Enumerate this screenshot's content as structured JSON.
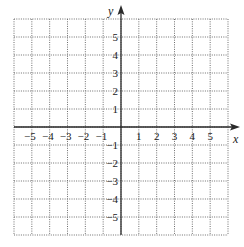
{
  "diagram": {
    "type": "coordinate-grid",
    "x_axis": {
      "label": "x",
      "min": -6,
      "max": 6,
      "tick_labels": [
        "−5",
        "−4",
        "−3",
        "−2",
        "−1",
        "1",
        "2",
        "3",
        "4",
        "5"
      ],
      "tick_values": [
        -5,
        -4,
        -3,
        -2,
        -1,
        1,
        2,
        3,
        4,
        5
      ]
    },
    "y_axis": {
      "label": "y",
      "min": -6,
      "max": 6,
      "tick_labels": [
        "5",
        "4",
        "3",
        "2",
        "1",
        "−1",
        "−2",
        "−3",
        "−4",
        "−5"
      ],
      "tick_values": [
        5,
        4,
        3,
        2,
        1,
        -1,
        -2,
        -3,
        -4,
        -5
      ]
    },
    "grid": {
      "style": "dotted",
      "step": 1
    },
    "colors": {
      "axis": "#2a2a2a",
      "grid": "#6e6e6e",
      "text": "#1a1a1a",
      "background": "#ffffff"
    }
  }
}
